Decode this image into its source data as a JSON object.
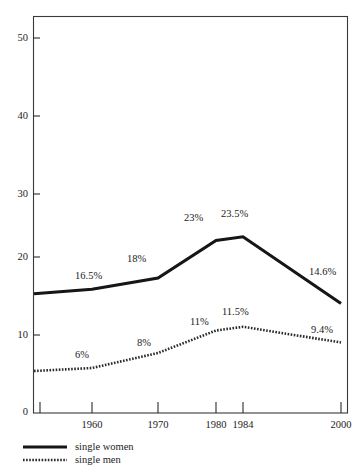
{
  "chart_data": {
    "type": "line",
    "title": "",
    "subtitle": "",
    "xlabel": "",
    "ylabel": "",
    "xlim": [
      1953,
      2000
    ],
    "ylim": [
      0,
      50
    ],
    "grid": false,
    "legend_position": "bottom-left",
    "x": [
      1953,
      1960,
      1970,
      1980,
      1984,
      2000
    ],
    "xticks": [
      1953,
      1960,
      1970,
      1980,
      1984,
      2000
    ],
    "xticklabels": [
      "",
      "1960",
      "1970",
      "1980",
      "1984",
      "2000"
    ],
    "yticks": [
      0,
      10,
      20,
      30,
      40,
      50
    ],
    "yticklabels": [
      "0",
      "10",
      "20",
      "30",
      "40",
      "50"
    ],
    "series": [
      {
        "name": "single women",
        "style": "solid",
        "values": [
          15.9,
          16.5,
          18.0,
          23.0,
          23.5,
          14.6
        ],
        "point_labels": [
          "",
          "16.5%",
          "18%",
          "23%",
          "23.5%",
          "14.6%"
        ]
      },
      {
        "name": "single men",
        "style": "dotted",
        "values": [
          5.6,
          6.0,
          8.0,
          11.0,
          11.5,
          9.4
        ],
        "point_labels": [
          "",
          "6%",
          "8%",
          "11%",
          "11.5%",
          "9.4%"
        ]
      }
    ],
    "annotations": [
      {
        "text": "16.5%",
        "series": "single women",
        "x": 1960,
        "y": 16.5
      },
      {
        "text": "18%",
        "series": "single women",
        "x": 1970,
        "y": 18.0
      },
      {
        "text": "23%",
        "series": "single women",
        "x": 1980,
        "y": 23.0
      },
      {
        "text": "23.5%",
        "series": "single women",
        "x": 1984,
        "y": 23.5
      },
      {
        "text": "14.6%",
        "series": "single women",
        "x": 2000,
        "y": 14.6
      },
      {
        "text": "6%",
        "series": "single men",
        "x": 1960,
        "y": 6.0
      },
      {
        "text": "8%",
        "series": "single men",
        "x": 1970,
        "y": 8.0
      },
      {
        "text": "11%",
        "series": "single men",
        "x": 1980,
        "y": 11.0
      },
      {
        "text": "11.5%",
        "series": "single men",
        "x": 1984,
        "y": 11.5
      },
      {
        "text": "9.4%",
        "series": "single men",
        "x": 2000,
        "y": 9.4
      }
    ]
  },
  "axes": {
    "y_labels": [
      "50",
      "40",
      "30",
      "20",
      "10",
      "0"
    ],
    "x_labels": [
      "1960",
      "1970",
      "1980",
      "1984",
      "2000"
    ]
  },
  "labels": {
    "women_1960": "16.5%",
    "women_1970": "18%",
    "women_1980": "23%",
    "women_1984": "23.5%",
    "women_2000": "14.6%",
    "men_1960": "6%",
    "men_1970": "8%",
    "men_1980": "11%",
    "men_1984": "11.5%",
    "men_2000": "9.4%"
  },
  "legend": {
    "items": [
      {
        "label": "single women",
        "style": "solid"
      },
      {
        "label": "single men",
        "style": "dotted"
      }
    ]
  },
  "colors": {
    "women_line": "#161616",
    "men_line": "#2a2a2a",
    "axis": "#2b2b2b",
    "text": "#1c1c1c",
    "background": "#ffffff"
  }
}
